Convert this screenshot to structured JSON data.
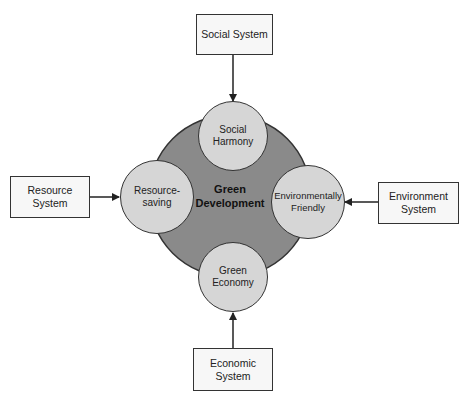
{
  "diagram": {
    "center": {
      "line1": "Green",
      "line2": "Development",
      "fill": "#8a8a8a"
    },
    "pillars": {
      "top": {
        "line1": "Social",
        "line2": "Harmony"
      },
      "left": {
        "line1": "Resource-",
        "line2": "saving"
      },
      "right": {
        "line1": "Environmentally",
        "line2": "Friendly"
      },
      "bottom": {
        "line1": "Green",
        "line2": "Economy"
      }
    },
    "systems": {
      "top": {
        "label": "Social System"
      },
      "left": {
        "label": "Resource System"
      },
      "right": {
        "line1": "Environment",
        "line2": "System"
      },
      "bottom": {
        "label": "Economic System"
      }
    },
    "colors": {
      "pillar_fill": "#d6d6d6",
      "box_fill": "#f7f7f7",
      "stroke": "#333333"
    }
  }
}
